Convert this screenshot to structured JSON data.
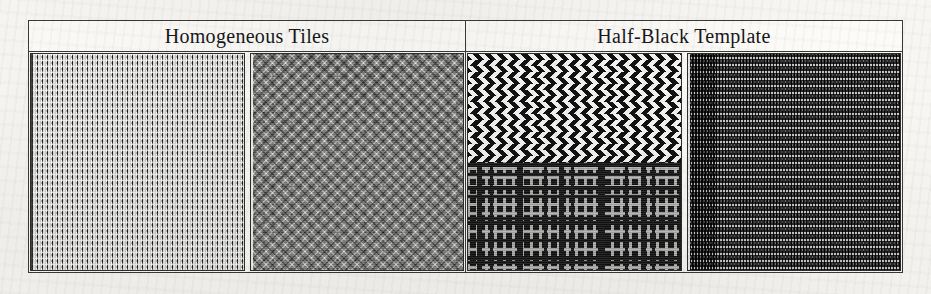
{
  "figure": {
    "columns": [
      {
        "header": "Homogeneous Tiles"
      },
      {
        "header": "Half-Black Template"
      }
    ],
    "panels": [
      {
        "id": "panel-1",
        "group": "Homogeneous Tiles",
        "texture_name": "triangle-grid-tile",
        "description": "Regular rectangular grid of small dark conical/triangular marks on a light paper-white background arranged in vertical columns.",
        "background_color": "#f2f1ee",
        "mark_color": "#1b1b1b",
        "cell_pitch_px": 5,
        "tone": "light"
      },
      {
        "id": "panel-2",
        "group": "Homogeneous Tiles",
        "texture_name": "diagonal-diamond-lattice-tile",
        "description": "Mid-grey diagonal lattice of interlocking diamonds with dark nodes at the lattice intersections.",
        "background_color": "#8e8e8c",
        "mark_color": "#1e1e1e",
        "cell_pitch_px": 9,
        "tone": "medium-grey"
      },
      {
        "id": "panel-3",
        "group": "Half-Black Template",
        "texture_name": "chevron-over-maze-template",
        "description": "Upper half is a high-contrast black and white diagonal chevron zigzag; lower half is a dense black maze/labyrinth pattern with light grey corridors.",
        "background_color": "#0d0d0d",
        "mark_color": "#f4f4f2",
        "split": "horizontal-half",
        "top_pattern": "chevron-zigzag",
        "bottom_pattern": "maze-labyrinth",
        "tone": "high-contrast"
      },
      {
        "id": "panel-4",
        "group": "Half-Black Template",
        "texture_name": "horizontal-stripe-template",
        "description": "Dark field of evenly spaced horizontal light stripes overlaid with a fine vertical dashed micro-texture.",
        "background_color": "#121212",
        "mark_color": "#bdbdbb",
        "stripe_pitch_px": 7,
        "tone": "dark"
      }
    ]
  }
}
